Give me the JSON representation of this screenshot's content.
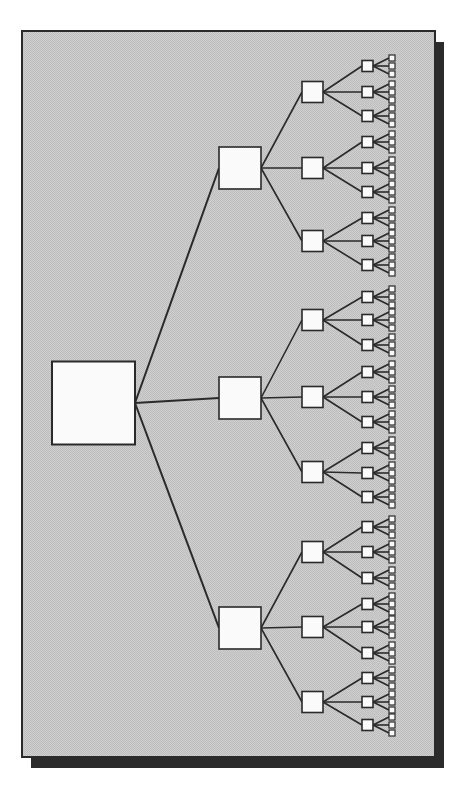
{
  "diagram": {
    "type": "tree",
    "branching_factor": 3,
    "depth": 5,
    "colors": {
      "page_background": "#ffffff",
      "panel_fill": "#c9c9c9",
      "panel_border": "#2a2a2a",
      "panel_shadow": "#2b2b2b",
      "node_fill": "#fafafa",
      "node_stroke": "#2a2a2a",
      "edge": "#2a2a2a"
    },
    "panel": {
      "x": 22,
      "y": 31,
      "width": 413,
      "height": 726,
      "shadow_offset": 9
    },
    "levels": [
      {
        "level": 0,
        "x": 52,
        "size": 83
      },
      {
        "level": 1,
        "x": 219,
        "size": 42
      },
      {
        "level": 2,
        "x": 302,
        "size": 21
      },
      {
        "level": 3,
        "x": 362,
        "size": 11
      },
      {
        "level": 4,
        "x": 389,
        "size": 6
      }
    ],
    "root": {
      "cy": 403
    },
    "level1_cy": [
      168,
      398,
      628
    ],
    "level2_cy": [
      [
        92,
        168,
        241
      ],
      [
        320,
        397,
        472
      ],
      [
        552,
        627,
        702
      ]
    ],
    "level3_cy": [
      [
        [
          66,
          92,
          116
        ],
        [
          142,
          168,
          192
        ],
        [
          218,
          241,
          265
        ]
      ],
      [
        [
          297,
          320,
          345
        ],
        [
          372,
          397,
          422
        ],
        [
          448,
          473,
          497
        ]
      ],
      [
        [
          527,
          552,
          578
        ],
        [
          604,
          627,
          653
        ],
        [
          678,
          702,
          725
        ]
      ]
    ],
    "level4_spacing": 8
  }
}
